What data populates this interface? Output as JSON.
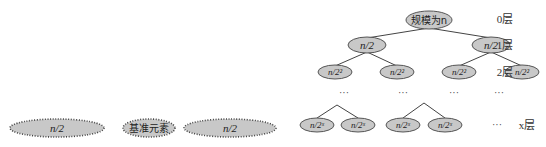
{
  "partition": {
    "left": "n/2",
    "pivot": "基准元素",
    "right": "n/2"
  },
  "tree": {
    "root": "规模为n",
    "level1": [
      "n/2",
      "n/2"
    ],
    "level2": [
      "n/2²",
      "n/2²",
      "n/2²",
      "n/2²"
    ],
    "ellipsis_row": [
      "···",
      "···",
      "···",
      "···"
    ],
    "levelx": [
      "n/2ˣ",
      "n/2ˣ",
      "n/2ˣ",
      "n/2ˣ"
    ],
    "levelx_ellipsis": "···"
  },
  "layers": {
    "l0": "0层",
    "l1": "1层",
    "l2": "2层",
    "lx": "x层"
  }
}
